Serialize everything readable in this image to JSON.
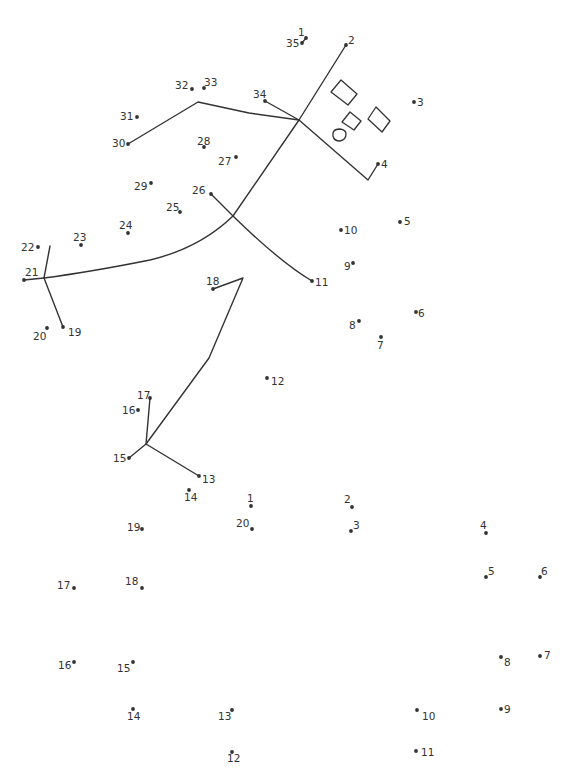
{
  "colors": {
    "ink": "#333333",
    "paper": "#ffffff"
  },
  "puzzle_upper": {
    "dots": [
      {
        "n": "1",
        "x": 306,
        "y": 38,
        "lx": 298,
        "ly": 36
      },
      {
        "n": "2",
        "x": 346,
        "y": 45,
        "lx": 348,
        "ly": 44
      },
      {
        "n": "3",
        "x": 414,
        "y": 102,
        "lx": 417,
        "ly": 106
      },
      {
        "n": "4",
        "x": 378,
        "y": 164,
        "lx": 381,
        "ly": 168
      },
      {
        "n": "5",
        "x": 400,
        "y": 222,
        "lx": 404,
        "ly": 225
      },
      {
        "n": "6",
        "x": 416,
        "y": 312,
        "lx": 418,
        "ly": 317
      },
      {
        "n": "7",
        "x": 381,
        "y": 337,
        "lx": 377,
        "ly": 349
      },
      {
        "n": "8",
        "x": 359,
        "y": 321,
        "lx": 349,
        "ly": 329
      },
      {
        "n": "9",
        "x": 353,
        "y": 263,
        "lx": 344,
        "ly": 270
      },
      {
        "n": "10",
        "x": 341,
        "y": 230,
        "lx": 344,
        "ly": 234
      },
      {
        "n": "11",
        "x": 312,
        "y": 281,
        "lx": 315,
        "ly": 286
      },
      {
        "n": "12",
        "x": 267,
        "y": 378,
        "lx": 271,
        "ly": 385
      },
      {
        "n": "13",
        "x": 199,
        "y": 476,
        "lx": 202,
        "ly": 483
      },
      {
        "n": "14",
        "x": 189,
        "y": 490,
        "lx": 184,
        "ly": 501
      },
      {
        "n": "15",
        "x": 129,
        "y": 458,
        "lx": 113,
        "ly": 462
      },
      {
        "n": "16",
        "x": 138,
        "y": 410,
        "lx": 122,
        "ly": 414
      },
      {
        "n": "17",
        "x": 150,
        "y": 398,
        "lx": 137,
        "ly": 399
      },
      {
        "n": "18",
        "x": 213,
        "y": 289,
        "lx": 206,
        "ly": 285
      },
      {
        "n": "19",
        "x": 63,
        "y": 327,
        "lx": 68,
        "ly": 336
      },
      {
        "n": "20",
        "x": 47,
        "y": 328,
        "lx": 33,
        "ly": 340
      },
      {
        "n": "21",
        "x": 24,
        "y": 280,
        "lx": 25,
        "ly": 276
      },
      {
        "n": "22",
        "x": 38,
        "y": 247,
        "lx": 21,
        "ly": 251
      },
      {
        "n": "23",
        "x": 81,
        "y": 245,
        "lx": 73,
        "ly": 241
      },
      {
        "n": "24",
        "x": 128,
        "y": 233,
        "lx": 119,
        "ly": 229
      },
      {
        "n": "25",
        "x": 180,
        "y": 212,
        "lx": 166,
        "ly": 211
      },
      {
        "n": "26",
        "x": 211,
        "y": 194,
        "lx": 192,
        "ly": 194
      },
      {
        "n": "27",
        "x": 236,
        "y": 157,
        "lx": 218,
        "ly": 165
      },
      {
        "n": "28",
        "x": 204,
        "y": 147,
        "lx": 197,
        "ly": 145
      },
      {
        "n": "29",
        "x": 151,
        "y": 183,
        "lx": 134,
        "ly": 190
      },
      {
        "n": "30",
        "x": 128,
        "y": 144,
        "lx": 112,
        "ly": 147
      },
      {
        "n": "31",
        "x": 137,
        "y": 117,
        "lx": 120,
        "ly": 120
      },
      {
        "n": "32",
        "x": 192,
        "y": 89,
        "lx": 175,
        "ly": 89
      },
      {
        "n": "33",
        "x": 204,
        "y": 88,
        "lx": 204,
        "ly": 86
      },
      {
        "n": "34",
        "x": 265,
        "y": 101,
        "lx": 253,
        "ly": 98
      },
      {
        "n": "35",
        "x": 302,
        "y": 43,
        "lx": 286,
        "ly": 47
      }
    ]
  },
  "puzzle_lower": {
    "dots": [
      {
        "n": "1",
        "x": 251,
        "y": 506,
        "lx": 247,
        "ly": 502
      },
      {
        "n": "2",
        "x": 352,
        "y": 507,
        "lx": 344,
        "ly": 503
      },
      {
        "n": "3",
        "x": 351,
        "y": 531,
        "lx": 353,
        "ly": 529
      },
      {
        "n": "4",
        "x": 486,
        "y": 533,
        "lx": 480,
        "ly": 529
      },
      {
        "n": "5",
        "x": 486,
        "y": 577,
        "lx": 488,
        "ly": 575
      },
      {
        "n": "6",
        "x": 540,
        "y": 577,
        "lx": 541,
        "ly": 575
      },
      {
        "n": "7",
        "x": 540,
        "y": 656,
        "lx": 544,
        "ly": 659
      },
      {
        "n": "8",
        "x": 501,
        "y": 657,
        "lx": 504,
        "ly": 666
      },
      {
        "n": "9",
        "x": 501,
        "y": 709,
        "lx": 504,
        "ly": 713
      },
      {
        "n": "10",
        "x": 417,
        "y": 710,
        "lx": 422,
        "ly": 720
      },
      {
        "n": "11",
        "x": 416,
        "y": 751,
        "lx": 421,
        "ly": 756
      },
      {
        "n": "12",
        "x": 232,
        "y": 752,
        "lx": 227,
        "ly": 762
      },
      {
        "n": "13",
        "x": 232,
        "y": 710,
        "lx": 218,
        "ly": 720
      },
      {
        "n": "14",
        "x": 133,
        "y": 709,
        "lx": 127,
        "ly": 720
      },
      {
        "n": "15",
        "x": 133,
        "y": 662,
        "lx": 117,
        "ly": 672
      },
      {
        "n": "16",
        "x": 74,
        "y": 662,
        "lx": 58,
        "ly": 669
      },
      {
        "n": "17",
        "x": 74,
        "y": 588,
        "lx": 57,
        "ly": 589
      },
      {
        "n": "18",
        "x": 142,
        "y": 588,
        "lx": 125,
        "ly": 585
      },
      {
        "n": "19",
        "x": 142,
        "y": 529,
        "lx": 127,
        "ly": 531
      },
      {
        "n": "20",
        "x": 252,
        "y": 529,
        "lx": 236,
        "ly": 527
      }
    ]
  }
}
